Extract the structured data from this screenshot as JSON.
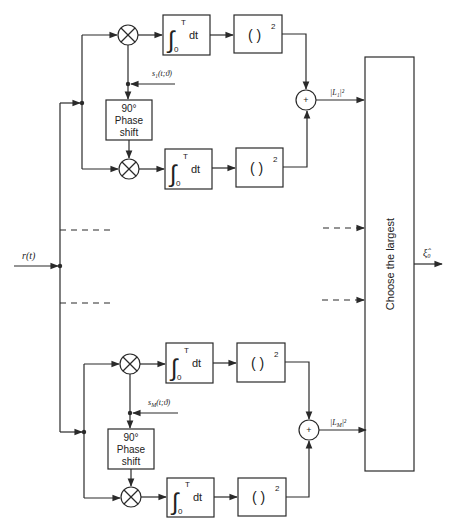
{
  "diagram": {
    "input_label": "r(t)",
    "output_label": "ξ̂₀",
    "decision_block": {
      "label": "Choose the largest"
    },
    "colors": {
      "line": "#2a2a2a",
      "background": "#ffffff"
    },
    "branches": [
      {
        "id": "branch-1",
        "reference_label": "s₁(t;ϑ)",
        "phase_shift": {
          "line1": "90°",
          "line2": "Phase",
          "line3": "shift"
        },
        "integrator": {
          "upper": "T",
          "lower": "0",
          "var": "dt"
        },
        "square": {
          "paren": "(   )",
          "exp": "2"
        },
        "adder_symbol": "+",
        "output_label": "|L₁|²"
      },
      {
        "id": "branch-M",
        "reference_label": "s_M(t;ϑ)",
        "reference_main": "s",
        "reference_sub": "M",
        "reference_rest": "(t;ϑ)",
        "phase_shift": {
          "line1": "90°",
          "line2": "Phase",
          "line3": "shift"
        },
        "integrator": {
          "upper": "T",
          "lower": "0",
          "var": "dt"
        },
        "square": {
          "paren": "(   )",
          "exp": "2"
        },
        "adder_symbol": "+",
        "output_label": "|L_M|²",
        "output_main": "|L",
        "output_sub": "M",
        "output_rest": "|²"
      }
    ],
    "ellipsis_note": "dashed lines indicate intermediate branches 2..M-1"
  }
}
